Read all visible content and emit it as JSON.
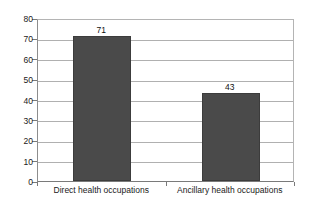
{
  "chart_data": {
    "type": "bar",
    "title": "",
    "subtitle": "",
    "xlabel": "",
    "ylabel": "",
    "categories": [
      "Direct health occupations",
      "Ancillary health occupations"
    ],
    "values": [
      71,
      43
    ],
    "value_labels": [
      "71",
      "43"
    ],
    "ylim": [
      0,
      80
    ],
    "y_ticks": [
      80,
      70,
      60,
      50,
      40,
      30,
      20,
      10,
      0
    ],
    "y_tick_labels": [
      "80",
      "70",
      "60",
      "50",
      "40",
      "30",
      "20",
      "10",
      "0"
    ],
    "grid": true,
    "legend": false,
    "legend_position": "none",
    "colors": {
      "bar_fill": "#4a4a4a",
      "bar_border": "#3c3c3c",
      "gridline": "#b0b0b0",
      "axis": "#7a7a7a",
      "text": "#1a1a1a",
      "background": "#ffffff"
    }
  }
}
